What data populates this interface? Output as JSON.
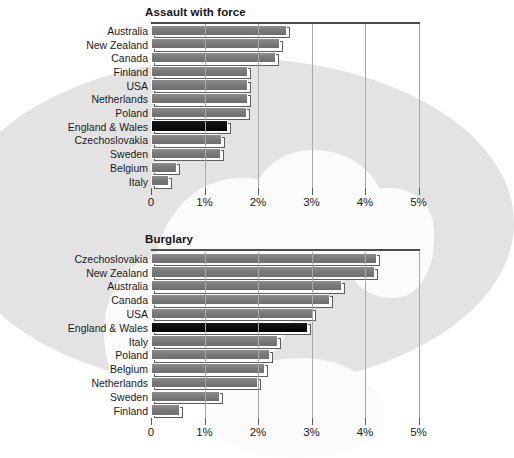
{
  "chart_data": [
    {
      "type": "bar",
      "orientation": "horizontal",
      "title": "Assault with force",
      "xlabel": "",
      "ylabel": "",
      "xlim": [
        0,
        5.4
      ],
      "grid": true,
      "legend": null,
      "tick_labels": [
        "0",
        "1%",
        "2%",
        "3%",
        "4%",
        "5%"
      ],
      "tick_values": [
        0,
        1,
        2,
        3,
        4,
        5
      ],
      "highlight_category": "England & Wales",
      "categories": [
        "Australia",
        "New Zealand",
        "Canada",
        "Finland",
        "USA",
        "Netherlands",
        "Poland",
        "England & Wales",
        "Czechoslovakia",
        "Sweden",
        "Belgium",
        "Italy"
      ],
      "values": [
        2.55,
        2.42,
        2.33,
        1.82,
        1.82,
        1.81,
        1.79,
        1.44,
        1.33,
        1.31,
        0.48,
        0.33
      ]
    },
    {
      "type": "bar",
      "orientation": "horizontal",
      "title": "Burglary",
      "xlabel": "",
      "ylabel": "",
      "xlim": [
        0,
        5.4
      ],
      "grid": true,
      "legend": null,
      "tick_labels": [
        "0",
        "1%",
        "2%",
        "3%",
        "4%",
        "5%"
      ],
      "tick_values": [
        0,
        1,
        2,
        3,
        4,
        5
      ],
      "highlight_category": "England & Wales",
      "categories": [
        "Czechoslovakia",
        "New Zealand",
        "Australia",
        "Canada",
        "USA",
        "England & Wales",
        "Italy",
        "Poland",
        "Belgium",
        "Netherlands",
        "Sweden",
        "Finland"
      ],
      "values": [
        4.22,
        4.18,
        3.57,
        3.35,
        3.03,
        2.93,
        2.37,
        2.22,
        2.13,
        2.0,
        1.29,
        0.55
      ]
    }
  ],
  "colors": {
    "bar_fill": "#7a7a7a",
    "bar_highlight": "#0b0b0b",
    "gridline": "#a8a8a8",
    "title_rule": "#4d4d4d",
    "globe": "#e3e3e3",
    "landmass": "#fbfbfb",
    "text": "#1a1a1a"
  },
  "caption": {
    "fragment": "..."
  }
}
